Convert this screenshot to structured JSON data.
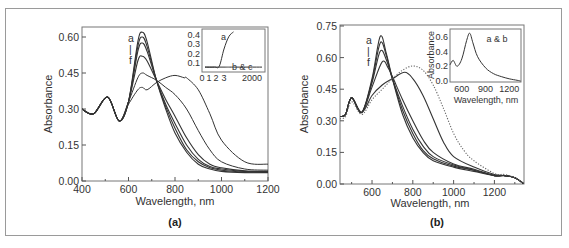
{
  "figure": {
    "panel_a_label": "(a)",
    "panel_b_label": "(b)"
  },
  "chart_data": [
    {
      "id": "a",
      "type": "line",
      "xlabel": "Wavelength, nm",
      "ylabel": "Absorbance",
      "xlim": [
        400,
        1200
      ],
      "ylim": [
        0.0,
        0.63
      ],
      "xticks": [
        400,
        600,
        800,
        1000,
        1200
      ],
      "yticks": [
        "0.00",
        "0.15",
        "0.30",
        "0.45",
        "0.60"
      ],
      "annotation": [
        "a",
        "|",
        "f"
      ],
      "series": [
        {
          "name": "a",
          "x": [
            400,
            450,
            510,
            560,
            600,
            640,
            660,
            680,
            720,
            760,
            800,
            850,
            900,
            950,
            1000,
            1100,
            1200
          ],
          "y": [
            0.3,
            0.28,
            0.35,
            0.25,
            0.33,
            0.58,
            0.62,
            0.58,
            0.42,
            0.3,
            0.2,
            0.12,
            0.07,
            0.05,
            0.04,
            0.035,
            0.035
          ]
        },
        {
          "name": "b",
          "x": [
            400,
            450,
            510,
            560,
            600,
            640,
            660,
            680,
            720,
            760,
            800,
            850,
            900,
            950,
            1000,
            1100,
            1200
          ],
          "y": [
            0.3,
            0.28,
            0.35,
            0.25,
            0.33,
            0.56,
            0.6,
            0.56,
            0.42,
            0.31,
            0.22,
            0.13,
            0.08,
            0.055,
            0.045,
            0.038,
            0.037
          ]
        },
        {
          "name": "c",
          "x": [
            400,
            450,
            510,
            560,
            600,
            640,
            660,
            680,
            720,
            760,
            800,
            850,
            900,
            950,
            1000,
            1100,
            1200
          ],
          "y": [
            0.3,
            0.28,
            0.35,
            0.25,
            0.33,
            0.54,
            0.575,
            0.54,
            0.42,
            0.32,
            0.24,
            0.15,
            0.09,
            0.06,
            0.05,
            0.04,
            0.038
          ]
        },
        {
          "name": "d",
          "x": [
            400,
            450,
            510,
            560,
            600,
            640,
            660,
            680,
            720,
            760,
            800,
            850,
            900,
            950,
            1000,
            1100,
            1200
          ],
          "y": [
            0.3,
            0.28,
            0.35,
            0.25,
            0.33,
            0.5,
            0.52,
            0.5,
            0.42,
            0.34,
            0.27,
            0.18,
            0.11,
            0.07,
            0.055,
            0.042,
            0.04
          ]
        },
        {
          "name": "e",
          "x": [
            400,
            450,
            510,
            560,
            600,
            640,
            660,
            680,
            720,
            760,
            800,
            850,
            900,
            950,
            1000,
            1100,
            1200
          ],
          "y": [
            0.3,
            0.28,
            0.35,
            0.25,
            0.33,
            0.43,
            0.45,
            0.44,
            0.42,
            0.39,
            0.36,
            0.3,
            0.21,
            0.13,
            0.08,
            0.05,
            0.045
          ]
        },
        {
          "name": "f",
          "x": [
            400,
            450,
            510,
            560,
            600,
            640,
            660,
            680,
            720,
            760,
            800,
            840,
            850,
            900,
            950,
            1000,
            1100,
            1200
          ],
          "y": [
            0.3,
            0.28,
            0.35,
            0.25,
            0.32,
            0.38,
            0.39,
            0.38,
            0.41,
            0.43,
            0.44,
            0.43,
            0.43,
            0.38,
            0.28,
            0.17,
            0.08,
            0.07
          ]
        }
      ],
      "inset": {
        "type": "line",
        "xticks": [
          "0",
          "1",
          "2",
          "3",
          "2000"
        ],
        "yticks": [
          "0.1",
          "0.2",
          "0.3",
          "0.4"
        ],
        "labels": [
          "a",
          "b & c"
        ],
        "series": [
          {
            "name": "a",
            "x": [
              0,
              1,
              1.5,
              2,
              2.5,
              3
            ],
            "y": [
              0.06,
              0.06,
              0.07,
              0.25,
              0.38,
              0.43
            ]
          },
          {
            "name": "b & c",
            "x": [
              0,
              1,
              2,
              3,
              2000
            ],
            "y": [
              0.06,
              0.06,
              0.06,
              0.06,
              0.06
            ]
          }
        ]
      }
    },
    {
      "id": "b",
      "type": "line",
      "xlabel": "Wavelength, nm",
      "ylabel": "Absorbance",
      "xlim": [
        443,
        1345
      ],
      "ylim": [
        0.0,
        0.75
      ],
      "xticks": [
        600,
        800,
        1000,
        1200
      ],
      "yticks": [
        "0.00",
        "0.15",
        "0.30",
        "0.45",
        "0.60",
        "0.75"
      ],
      "annotation": [
        "a",
        "|",
        "f"
      ],
      "series": [
        {
          "name": "a",
          "x": [
            443,
            470,
            500,
            550,
            600,
            640,
            670,
            700,
            750,
            800,
            850,
            900,
            1000,
            1100,
            1200,
            1250,
            1300,
            1345
          ],
          "y": [
            0.32,
            0.33,
            0.41,
            0.34,
            0.5,
            0.7,
            0.62,
            0.5,
            0.33,
            0.22,
            0.15,
            0.11,
            0.08,
            0.06,
            0.04,
            0.04,
            0.03,
            0.0
          ]
        },
        {
          "name": "b",
          "x": [
            443,
            470,
            500,
            550,
            600,
            640,
            670,
            700,
            750,
            800,
            850,
            900,
            1000,
            1100,
            1200,
            1250,
            1300,
            1345
          ],
          "y": [
            0.32,
            0.33,
            0.41,
            0.34,
            0.49,
            0.67,
            0.61,
            0.5,
            0.35,
            0.24,
            0.16,
            0.12,
            0.085,
            0.065,
            0.04,
            0.04,
            0.03,
            0.0
          ]
        },
        {
          "name": "c",
          "x": [
            443,
            470,
            500,
            550,
            600,
            640,
            670,
            700,
            750,
            800,
            850,
            900,
            1000,
            1100,
            1200,
            1250,
            1300,
            1345
          ],
          "y": [
            0.32,
            0.33,
            0.41,
            0.34,
            0.48,
            0.63,
            0.59,
            0.5,
            0.37,
            0.26,
            0.18,
            0.13,
            0.09,
            0.065,
            0.04,
            0.04,
            0.03,
            0.0
          ]
        },
        {
          "name": "d",
          "x": [
            443,
            470,
            500,
            550,
            600,
            650,
            680,
            700,
            750,
            800,
            850,
            900,
            1000,
            1100,
            1200,
            1250,
            1300,
            1345
          ],
          "y": [
            0.32,
            0.33,
            0.41,
            0.34,
            0.46,
            0.58,
            0.55,
            0.51,
            0.4,
            0.3,
            0.21,
            0.15,
            0.095,
            0.07,
            0.04,
            0.04,
            0.03,
            0.0
          ]
        },
        {
          "name": "e",
          "x": [
            443,
            470,
            500,
            550,
            600,
            650,
            700,
            760,
            800,
            850,
            900,
            950,
            1000,
            1100,
            1200,
            1250,
            1300,
            1345
          ],
          "y": [
            0.32,
            0.33,
            0.41,
            0.34,
            0.42,
            0.47,
            0.5,
            0.53,
            0.5,
            0.42,
            0.31,
            0.2,
            0.13,
            0.08,
            0.045,
            0.04,
            0.03,
            0.0
          ]
        },
        {
          "name": "f (dotted)",
          "x": [
            443,
            470,
            500,
            550,
            600,
            650,
            700,
            750,
            800,
            850,
            900,
            950,
            1000,
            1050,
            1100,
            1200,
            1250,
            1300,
            1345
          ],
          "y": [
            0.31,
            0.32,
            0.39,
            0.33,
            0.4,
            0.45,
            0.5,
            0.54,
            0.56,
            0.54,
            0.47,
            0.36,
            0.24,
            0.16,
            0.11,
            0.05,
            0.045,
            0.03,
            0.0
          ]
        }
      ],
      "inset": {
        "type": "line",
        "xlabel": "Wavelength, nm",
        "ylabel": "Absorbance",
        "xticks": [
          "600",
          "900",
          "1200"
        ],
        "yticks": [
          "0.0",
          "0.2",
          "0.4",
          "0.6"
        ],
        "labels": [
          "a & b"
        ],
        "series": [
          {
            "name": "a & b",
            "x": [
              450,
              490,
              540,
              600,
              660,
              700,
              740,
              800,
              900,
              1000,
              1100,
              1200,
              1300,
              1345
            ],
            "y": [
              0.22,
              0.28,
              0.2,
              0.3,
              0.55,
              0.65,
              0.52,
              0.33,
              0.18,
              0.1,
              0.06,
              0.03,
              0.01,
              0.0
            ]
          }
        ]
      }
    }
  ]
}
